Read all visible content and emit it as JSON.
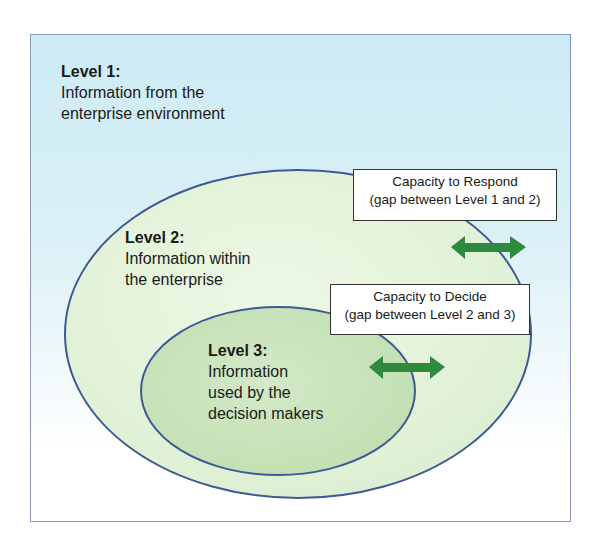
{
  "diagram": {
    "level1": {
      "title": "Level 1:",
      "line1": "Information from the",
      "line2": "enterprise environment"
    },
    "level2": {
      "title": "Level 2:",
      "line1": "Information within",
      "line2": "the enterprise"
    },
    "level3": {
      "title": "Level 3:",
      "line1": "Information",
      "line2": "used by the",
      "line3": "decision makers"
    },
    "respond_box": {
      "line1": "Capacity to Respond",
      "line2": "(gap between Level 1 and 2)"
    },
    "decide_box": {
      "line1": "Capacity to Decide",
      "line2": "(gap between Level 2 and 3)"
    },
    "colors": {
      "frame_bg": "#cdebf4",
      "outer_ellipse_fill": "#e4f3d9",
      "inner_ellipse_fill": "#c9e3bb",
      "ellipse_stroke": "#3d5a95",
      "arrow": "#2f8a3e"
    },
    "icons": [
      "double-arrow-icon",
      "double-arrow-icon"
    ]
  }
}
